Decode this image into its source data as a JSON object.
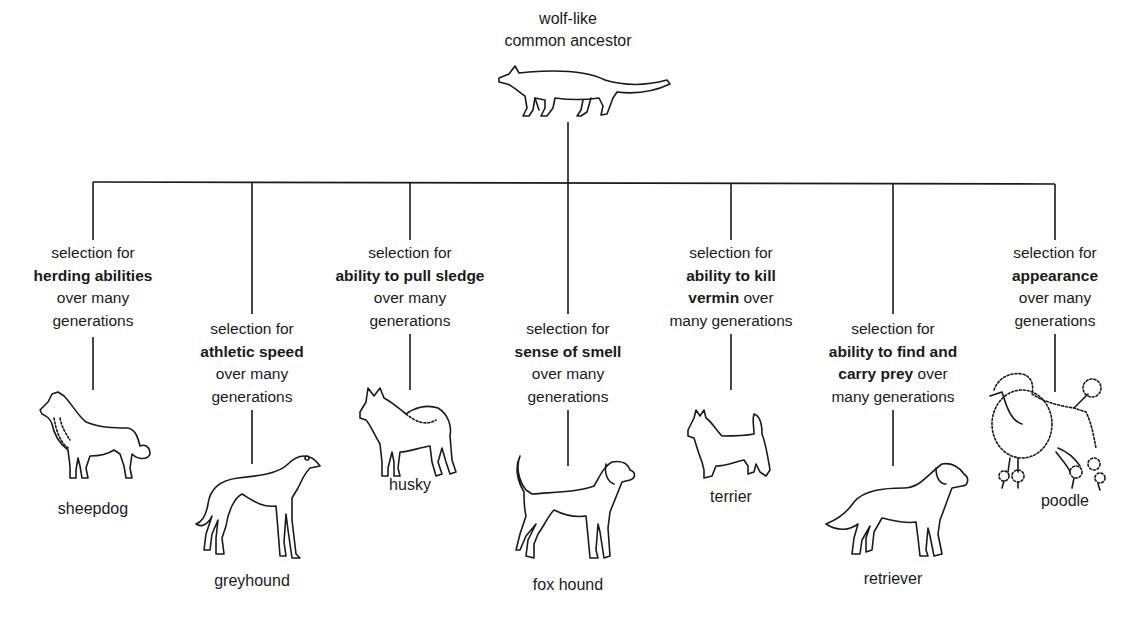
{
  "ancestor": {
    "title_line1": "wolf-like",
    "title_line2": "common ancestor",
    "icon": "wolf-icon"
  },
  "branches": [
    {
      "id": "sheepdog",
      "selection_prefix": "selection for",
      "trait_bold": "herding abilities",
      "suffix_line1": "over many",
      "suffix_line2": "generations",
      "breed": "sheepdog",
      "icon": "sheepdog-icon"
    },
    {
      "id": "greyhound",
      "selection_prefix": "selection for",
      "trait_bold": "athletic speed",
      "suffix_line1": "over many",
      "suffix_line2": "generations",
      "breed": "greyhound",
      "icon": "greyhound-icon"
    },
    {
      "id": "husky",
      "selection_prefix": "selection for",
      "trait_bold": "ability to pull sledge",
      "suffix_line1": "over many",
      "suffix_line2": "generations",
      "breed": "husky",
      "icon": "husky-icon"
    },
    {
      "id": "fox-hound",
      "selection_prefix": "selection for",
      "trait_bold": "sense of smell",
      "suffix_line1": "over many",
      "suffix_line2": "generations",
      "breed": "fox hound",
      "icon": "fox-hound-icon"
    },
    {
      "id": "terrier",
      "selection_prefix": "selection for",
      "trait_bold_line1": "ability to kill",
      "trait_bold_line2": "vermin",
      "trait_tail": " over",
      "suffix_line2": "many generations",
      "breed": "terrier",
      "icon": "terrier-icon"
    },
    {
      "id": "retriever",
      "selection_prefix": "selection for",
      "trait_bold_line1": "ability to find and",
      "trait_bold_line2": "carry prey",
      "trait_tail": " over",
      "suffix_line2": "many generations",
      "breed": "retriever",
      "icon": "retriever-icon"
    },
    {
      "id": "poodle",
      "selection_prefix": "selection for",
      "trait_bold": "appearance",
      "suffix_line1": "over many",
      "suffix_line2": "generations",
      "breed": "poodle",
      "icon": "poodle-icon"
    }
  ],
  "colors": {
    "ink": "#1a1a1a",
    "background": "#ffffff"
  }
}
